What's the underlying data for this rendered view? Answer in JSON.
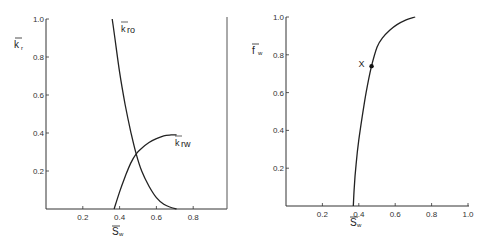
{
  "chart_data": [
    {
      "type": "line",
      "title": "",
      "xlabel": "S̄w",
      "ylabel": "k̄r",
      "xlim": [
        0,
        1.0
      ],
      "ylim": [
        0,
        1.0
      ],
      "grid": false,
      "xticks": [
        "0.2",
        "0.4",
        "0.6",
        "0.8"
      ],
      "yticks": [
        "0.2",
        "0.4",
        "0.6",
        "0.8",
        "1.0"
      ],
      "series": [
        {
          "name": "k̄ro",
          "x": [
            0.36,
            0.38,
            0.4,
            0.43,
            0.46,
            0.49,
            0.52,
            0.56,
            0.6,
            0.64,
            0.68,
            0.71
          ],
          "y": [
            1.0,
            0.86,
            0.72,
            0.55,
            0.41,
            0.29,
            0.2,
            0.12,
            0.06,
            0.025,
            0.008,
            0.0
          ]
        },
        {
          "name": "k̄rw",
          "x": [
            0.37,
            0.4,
            0.43,
            0.46,
            0.49,
            0.52,
            0.56,
            0.6,
            0.64,
            0.68,
            0.71
          ],
          "y": [
            0.0,
            0.09,
            0.17,
            0.24,
            0.29,
            0.32,
            0.35,
            0.37,
            0.385,
            0.39,
            0.39
          ]
        }
      ],
      "annotations": [
        {
          "text": "k̄ro",
          "x": 0.41,
          "y": 0.97
        },
        {
          "text": "k̄rw",
          "x": 0.74,
          "y": 0.35
        }
      ]
    },
    {
      "type": "line",
      "title": "",
      "xlabel": "S̄w",
      "ylabel": "f̄w",
      "xlim": [
        0,
        1.0
      ],
      "ylim": [
        0,
        1.0
      ],
      "grid": false,
      "xticks": [
        "0.2",
        "0.4",
        "0.6",
        "0.8",
        "1.0"
      ],
      "yticks": [
        "0.2",
        "0.4",
        "0.6",
        "0.8",
        "1.0"
      ],
      "series": [
        {
          "name": "f̄w",
          "x": [
            0.37,
            0.375,
            0.385,
            0.4,
            0.42,
            0.44,
            0.47,
            0.5,
            0.53,
            0.57,
            0.61,
            0.66,
            0.71
          ],
          "y": [
            0.0,
            0.1,
            0.22,
            0.35,
            0.48,
            0.6,
            0.74,
            0.84,
            0.89,
            0.93,
            0.96,
            0.985,
            1.0
          ]
        }
      ],
      "annotations": [
        {
          "text": "X",
          "x": 0.47,
          "y": 0.74,
          "marker": "dot"
        }
      ]
    }
  ],
  "left_chart": {
    "ylabel_main": "k",
    "ylabel_sub": "r",
    "xlabel_main": "S",
    "xlabel_sub": "w",
    "xticks": [
      "0.2",
      "0.4",
      "0.6",
      "0.8"
    ],
    "yticks": [
      "0.2",
      "0.4",
      "0.6",
      "0.8",
      "1.0"
    ],
    "kro_label_main": "k",
    "kro_label_sub": "ro",
    "krw_label_main": "k",
    "krw_label_sub": "rw"
  },
  "right_chart": {
    "ylabel_main": "f",
    "ylabel_sub": "w",
    "xlabel_main": "S",
    "xlabel_sub": "w",
    "xticks": [
      "0.2",
      "0.4",
      "0.6",
      "0.8",
      "1.0"
    ],
    "yticks": [
      "0.2",
      "0.4",
      "0.6",
      "0.8",
      "1.0"
    ],
    "point_label": "X"
  },
  "colors": {
    "line": "#222222",
    "axis": "#333333"
  }
}
